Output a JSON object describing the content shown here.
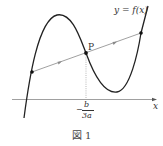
{
  "figure": {
    "curve_label": "y = f(x)",
    "point_label": "P",
    "x_axis_label": "x",
    "tick_label": {
      "sign": "−",
      "numerator": "b",
      "denominator": "3a"
    },
    "caption": "図 1"
  },
  "colors": {
    "curve": "#222222",
    "axis": "#777777",
    "secant": "#888888",
    "guide": "#999999"
  }
}
